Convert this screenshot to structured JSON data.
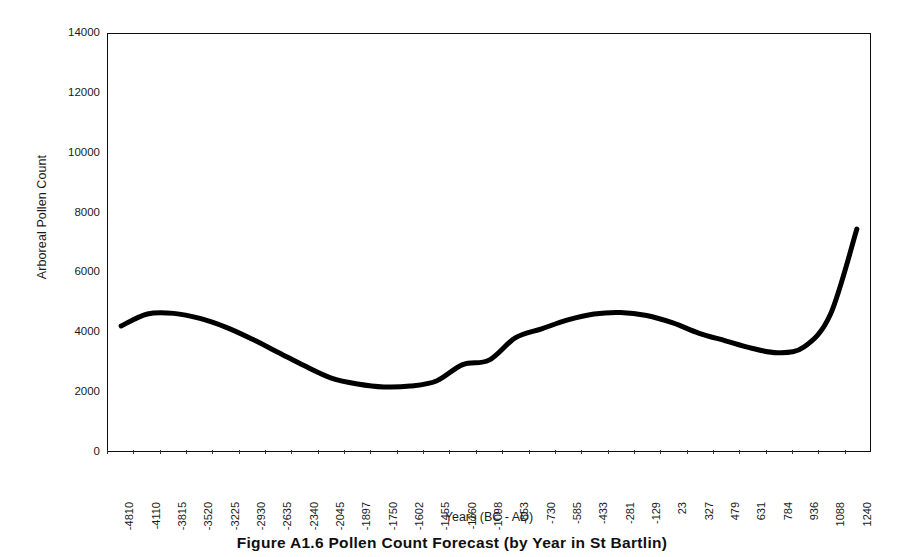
{
  "figure": {
    "caption": "Figure A1.6    Pollen Count Forecast (by Year in St Bartlin)"
  },
  "chart_data": {
    "type": "line",
    "title": "",
    "xlabel": "Years (BC - AD)",
    "ylabel": "Arboreal Pollen Count",
    "ylim": [
      0,
      14000
    ],
    "y_ticks": [
      0,
      2000,
      4000,
      6000,
      8000,
      10000,
      12000,
      14000
    ],
    "grid": false,
    "legend": null,
    "line_color": "#000000",
    "line_width": 5,
    "categories": [
      "-4810",
      "-4110",
      "-3815",
      "-3520",
      "-3225",
      "-2930",
      "-2635",
      "-2340",
      "-2045",
      "-1897",
      "-1750",
      "-1602",
      "-1455",
      "-1160",
      "-1098",
      "-853",
      "-730",
      "-585",
      "-433",
      "-281",
      "-129",
      "23",
      "327",
      "479",
      "631",
      "784",
      "936",
      "1088",
      "1240"
    ],
    "values": [
      4200,
      4600,
      4620,
      4450,
      4150,
      3750,
      3300,
      2850,
      2450,
      2250,
      2150,
      2180,
      2350,
      2900,
      3050,
      3800,
      4100,
      4400,
      4600,
      4650,
      4550,
      4300,
      3950,
      3700,
      3450,
      3300,
      3500,
      4600,
      7450
    ]
  }
}
